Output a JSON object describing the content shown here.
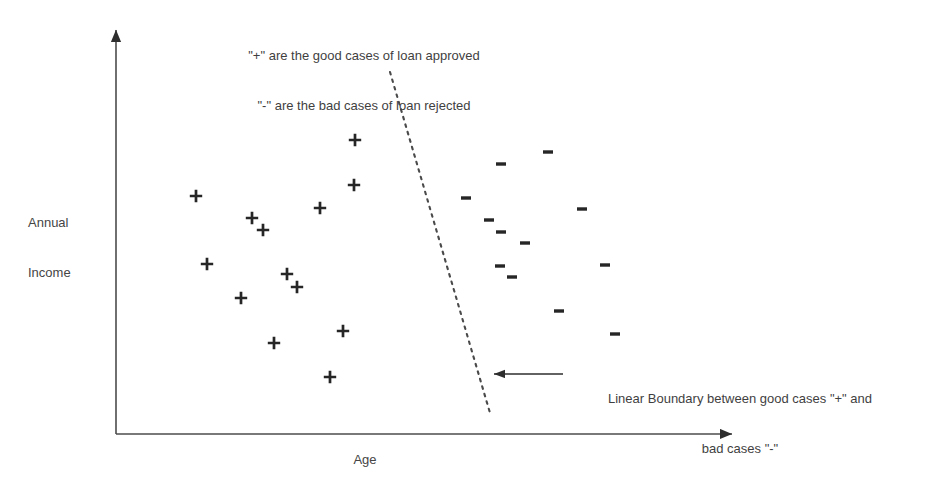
{
  "figure": {
    "background_color": "#ffffff",
    "ink_color": "#262626",
    "text_color": "#3f3f3f"
  },
  "legend_note": {
    "line1": "\"+\" are the good cases of loan approved",
    "line2": "\"-\" are the bad cases of loan rejected"
  },
  "boundary_note": {
    "line1": "Linear Boundary between good cases \"+\" and",
    "line2": "bad cases \"-\""
  },
  "axes": {
    "y_label_line1": "Annual",
    "y_label_line2": "Income",
    "x_label": "Age"
  },
  "chart_data": {
    "type": "scatter",
    "title": "",
    "xlabel": "Age",
    "ylabel": "Annual Income",
    "grid": false,
    "legend_position": "top-center",
    "axis_style": "arrow-axes-unlabeled-ticks",
    "xlim": [
      116,
      740
    ],
    "ylim": [
      434,
      22
    ],
    "note": "Values are pixel coordinates within the 928x497 figure; axes carry no numeric ticks.",
    "series": [
      {
        "name": "good cases of loan approved",
        "marker": "+",
        "color": "#262626",
        "count": 13,
        "points": [
          {
            "x": 355,
            "y": 140
          },
          {
            "x": 354,
            "y": 185
          },
          {
            "x": 196,
            "y": 196
          },
          {
            "x": 320,
            "y": 208
          },
          {
            "x": 252,
            "y": 218
          },
          {
            "x": 263,
            "y": 230
          },
          {
            "x": 207,
            "y": 264
          },
          {
            "x": 287,
            "y": 274
          },
          {
            "x": 297,
            "y": 287
          },
          {
            "x": 241,
            "y": 298
          },
          {
            "x": 343,
            "y": 331
          },
          {
            "x": 274,
            "y": 343
          },
          {
            "x": 330,
            "y": 377
          }
        ]
      },
      {
        "name": "bad cases of loan rejected",
        "marker": "-",
        "color": "#262626",
        "count": 12,
        "points": [
          {
            "x": 548,
            "y": 152
          },
          {
            "x": 501,
            "y": 164
          },
          {
            "x": 466,
            "y": 198
          },
          {
            "x": 582,
            "y": 209
          },
          {
            "x": 489,
            "y": 220
          },
          {
            "x": 501,
            "y": 232
          },
          {
            "x": 525,
            "y": 243
          },
          {
            "x": 605,
            "y": 265
          },
          {
            "x": 500,
            "y": 266
          },
          {
            "x": 512,
            "y": 277
          },
          {
            "x": 559,
            "y": 311
          },
          {
            "x": 615,
            "y": 334
          }
        ]
      }
    ],
    "annotations": [
      {
        "name": "decision-boundary",
        "type": "dashed-line",
        "from": {
          "x": 390,
          "y": 72
        },
        "to": {
          "x": 490,
          "y": 413
        },
        "color": "#4a4a4a"
      },
      {
        "name": "boundary-callout-arrow",
        "type": "arrow",
        "from": {
          "x": 563,
          "y": 374
        },
        "to": {
          "x": 487,
          "y": 374
        },
        "color": "#3a3a3a"
      }
    ]
  }
}
